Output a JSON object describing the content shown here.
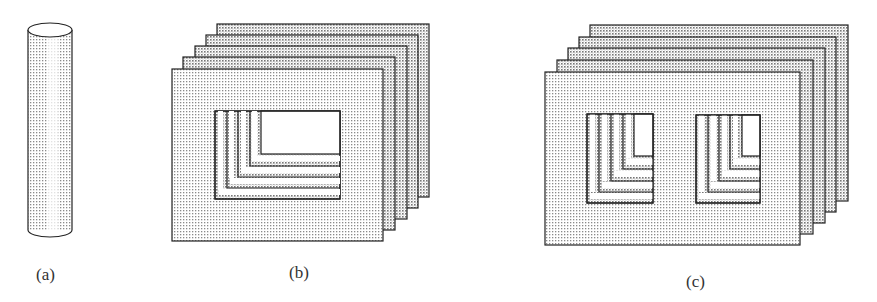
{
  "figure": {
    "panels": [
      {
        "id": "a",
        "label": "(a)",
        "shape": "cylinder"
      },
      {
        "id": "b",
        "label": "(b)",
        "shape": "stacked-laminations-single-window",
        "sheet_count": 5
      },
      {
        "id": "c",
        "label": "(c)",
        "shape": "stacked-laminations-double-window",
        "sheet_count": 5
      }
    ],
    "colors": {
      "stroke": "#222222",
      "fill_dot": "#8a8a8a",
      "background": "#ffffff"
    }
  }
}
